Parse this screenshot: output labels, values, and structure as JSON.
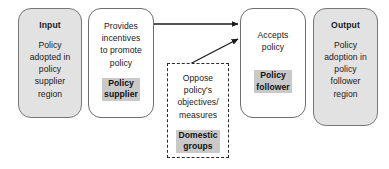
{
  "diagram": {
    "background_color": "#ffffff",
    "shaded_fill": "#e2e2e2",
    "highlight_fill": "#c9c9c9",
    "border_color": "#6e6e6e",
    "arrow_color": "#1a1a1a",
    "nodes": [
      {
        "id": "input",
        "title": "Input",
        "body": "Policy\nadopted in\npolicy\nsupplier\nregion",
        "style": "shaded-rounded"
      },
      {
        "id": "supplier",
        "title": "",
        "body": "Provides\nincentives\nto promote\npolicy",
        "actor": "Policy\nsupplier",
        "style": "plain-rounded"
      },
      {
        "id": "opposition",
        "title": "",
        "body": "Oppose\npolicy's\nobjectives/\nmeasures",
        "actor": "Domestic\ngroups",
        "style": "dashed-rectangle"
      },
      {
        "id": "accepts",
        "title": "",
        "body": "Accepts\npolicy",
        "actor": "Policy\nfollower",
        "style": "plain-rounded"
      },
      {
        "id": "output",
        "title": "Output",
        "body": "Policy\nadoption in\npolicy\nfollower\nregion",
        "style": "shaded-rounded"
      }
    ],
    "connectors": [
      {
        "id": "supplier-to-accepts",
        "from": "supplier",
        "to": "accepts",
        "shape": "horizontal",
        "label": ""
      },
      {
        "id": "opposition-to-accepts",
        "from": "opposition",
        "to": "accepts",
        "shape": "diagonal",
        "label": ""
      }
    ]
  }
}
